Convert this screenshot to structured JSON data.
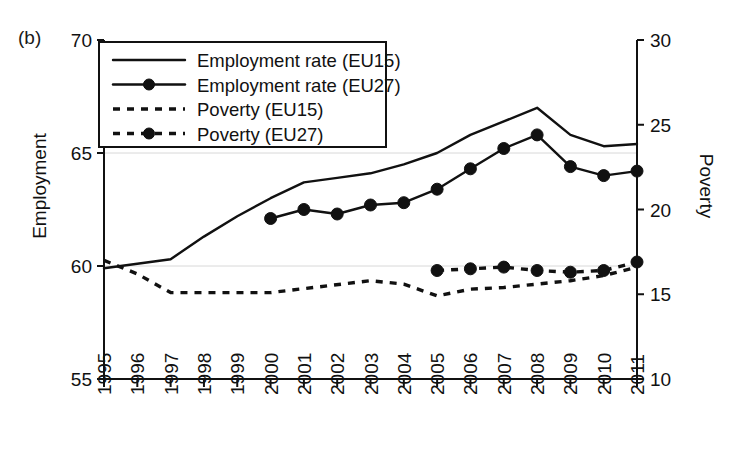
{
  "panel": {
    "label": "(b)"
  },
  "axes": {
    "left": {
      "title": "Employment",
      "min": 55,
      "max": 70,
      "ticks": [
        55,
        60,
        65,
        70
      ]
    },
    "right": {
      "title": "Poverty",
      "min": 10,
      "max": 30,
      "ticks": [
        10,
        15,
        20,
        25,
        30
      ]
    },
    "x": {
      "ticks": [
        "1995",
        "1996",
        "1997",
        "1998",
        "1999",
        "2000",
        "2001",
        "2002",
        "2003",
        "2004",
        "2005",
        "2006",
        "2007",
        "2008",
        "2009",
        "2010",
        "2011"
      ]
    }
  },
  "legend": {
    "items": [
      {
        "label": "Employment rate (EU15)",
        "style": "solid",
        "marker": false
      },
      {
        "label": "Employment rate (EU27)",
        "style": "solid",
        "marker": true
      },
      {
        "label": "Poverty (EU15)",
        "style": "dashed",
        "marker": false
      },
      {
        "label": "Poverty (EU27)",
        "style": "dashed",
        "marker": true
      }
    ]
  },
  "colors": {
    "ink": "#111111",
    "grid": "#d8d8d8",
    "background": "#ffffff"
  },
  "chart_data": {
    "type": "line",
    "title": "",
    "xlabel": "",
    "ylabel": "Employment",
    "y2label": "Poverty",
    "ylim": [
      55,
      70
    ],
    "y2lim": [
      10,
      30
    ],
    "grid": true,
    "legend_position": "top-left-inside",
    "x": [
      1995,
      1996,
      1997,
      1998,
      1999,
      2000,
      2001,
      2002,
      2003,
      2004,
      2005,
      2006,
      2007,
      2008,
      2009,
      2010,
      2011
    ],
    "series": [
      {
        "name": "Employment rate (EU15)",
        "axis": "left",
        "style": "solid",
        "marker": "none",
        "x": [
          1995,
          1996,
          1997,
          1998,
          1999,
          2000,
          2001,
          2002,
          2003,
          2004,
          2005,
          2006,
          2007,
          2008,
          2009,
          2010,
          2011
        ],
        "values": [
          59.9,
          60.1,
          60.3,
          61.3,
          62.2,
          63.0,
          63.7,
          63.9,
          64.1,
          64.5,
          65.0,
          65.8,
          66.4,
          67.0,
          65.8,
          65.3,
          65.4
        ]
      },
      {
        "name": "Employment rate (EU27)",
        "axis": "left",
        "style": "solid",
        "marker": "circle",
        "x": [
          2000,
          2001,
          2002,
          2003,
          2004,
          2005,
          2006,
          2007,
          2008,
          2009,
          2010,
          2011
        ],
        "values": [
          62.1,
          62.5,
          62.3,
          62.7,
          62.8,
          63.4,
          64.3,
          65.2,
          65.8,
          64.4,
          64.0,
          64.2
        ]
      },
      {
        "name": "Poverty (EU15)",
        "axis": "right",
        "style": "dashed",
        "marker": "none",
        "x": [
          1995,
          1996,
          1997,
          1998,
          1999,
          2000,
          2003,
          2004,
          2005,
          2006,
          2007,
          2008,
          2009,
          2010,
          2011
        ],
        "values": [
          17.0,
          16.2,
          15.1,
          15.1,
          15.1,
          15.1,
          15.8,
          15.6,
          14.9,
          15.3,
          15.4,
          15.6,
          15.8,
          16.1,
          16.6
        ]
      },
      {
        "name": "Poverty (EU27)",
        "axis": "right",
        "style": "dashed",
        "marker": "circle",
        "x": [
          2005,
          2006,
          2007,
          2008,
          2009,
          2010,
          2011
        ],
        "values": [
          16.4,
          16.5,
          16.6,
          16.4,
          16.3,
          16.4,
          16.9
        ]
      }
    ]
  }
}
